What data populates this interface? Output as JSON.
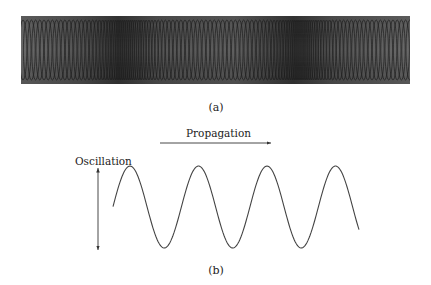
{
  "figure": {
    "panel_a": {
      "caption": "(a)",
      "description": "Photograph of a slinky spring showing compression regions",
      "colors": {
        "background": "#5a5a5a",
        "coil": "#1e1e1e",
        "compression": "#2a2a2a"
      }
    },
    "panel_b": {
      "caption": "(b)",
      "propagation_label": "Propagation",
      "oscillation_label": "Oscillation",
      "wave": {
        "cycles": 3.5,
        "stroke": "#444444"
      }
    }
  }
}
